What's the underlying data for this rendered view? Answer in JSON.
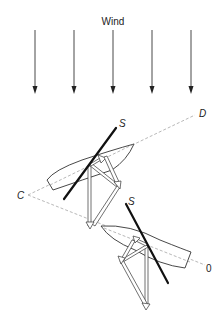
{
  "diagram": {
    "wind": {
      "label": "Wind",
      "arrow_count": 5,
      "direction": "down"
    },
    "points": {
      "C": "C",
      "D": "D",
      "O": "0"
    },
    "boats": [
      {
        "name": "upper-boat",
        "sail_label": "S"
      },
      {
        "name": "lower-boat",
        "sail_label": "S"
      }
    ],
    "colors": {
      "line": "#333333",
      "sail": "#111111",
      "course": "#888888",
      "background": "#ffffff"
    }
  }
}
